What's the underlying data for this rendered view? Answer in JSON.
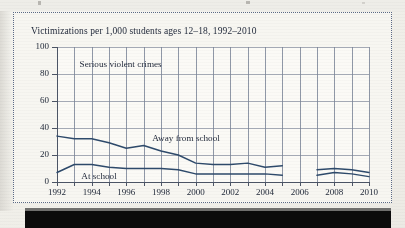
{
  "figure": {
    "frame_style": "dotted",
    "frame_color": "#5b6a86",
    "background_color": "#f7f6f1"
  },
  "chart_data": {
    "type": "line",
    "title": "Victimizations per 1,000 students ages 12–18, 1992–2010",
    "subtitle": "Serious violent crimes",
    "xlabel": "",
    "ylabel": "",
    "ylim": [
      0,
      100
    ],
    "xlim": [
      1992,
      2010
    ],
    "yticks": [
      0,
      20,
      40,
      60,
      80,
      100
    ],
    "ytick_labels": [
      "0",
      "20",
      "40",
      "60",
      "80",
      "100"
    ],
    "xticks": [
      1992,
      1994,
      1996,
      1998,
      2000,
      2002,
      2004,
      2006,
      2008,
      2010
    ],
    "xtick_labels": [
      "1992",
      "1994",
      "1996",
      "1998",
      "2000",
      "2002",
      "2004",
      "2006",
      "2008",
      "2010"
    ],
    "grid": "vertical gridlines at every year, horizontal gridlines at every y tick",
    "legend_position": "inline annotations on plot",
    "line_color": "#2e4a6b",
    "x": [
      1992,
      1993,
      1994,
      1995,
      1996,
      1997,
      1998,
      1999,
      2000,
      2001,
      2002,
      2003,
      2004,
      2005,
      2007,
      2008,
      2009,
      2010
    ],
    "series": [
      {
        "name": "Away from school",
        "values": [
          34,
          32,
          32,
          29,
          25,
          27,
          23,
          20,
          14,
          13,
          13,
          14,
          11,
          12,
          9,
          10,
          9,
          7
        ],
        "annotation": "Away from school",
        "note": "data gap at 2006"
      },
      {
        "name": "At school",
        "values": [
          7,
          13,
          13,
          11,
          10,
          10,
          10,
          9,
          6,
          6,
          6,
          6,
          6,
          5,
          5,
          7,
          6,
          4
        ],
        "annotation": "At school",
        "note": "data gap at 2006"
      }
    ],
    "annotations": [
      {
        "text": "Serious violent crimes",
        "x": 1993.3,
        "y": 86
      },
      {
        "text": "Away from school",
        "x": 1997.5,
        "y": 31
      },
      {
        "text": "At school",
        "x": 1993.4,
        "y": 3
      }
    ]
  }
}
